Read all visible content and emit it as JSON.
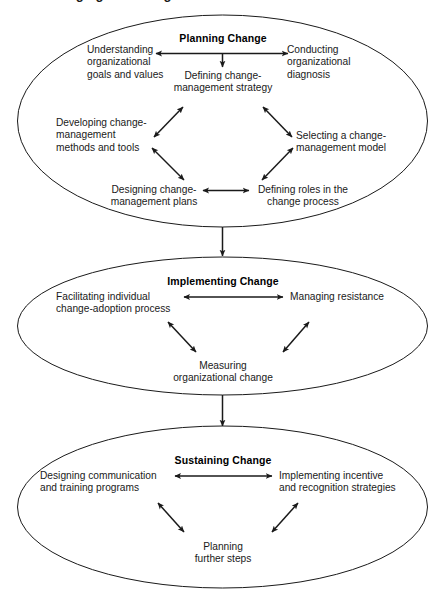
{
  "figure": {
    "title": "Managing the Change Process",
    "title_truncated": true,
    "background_color": "#ffffff",
    "line_color": "#1a1a1a",
    "text_color": "#1a1a1a"
  },
  "stages": [
    {
      "id": "planning",
      "title": "Planning Change",
      "nodes": [
        {
          "id": "understanding-goals",
          "text": "Understanding\norganizational\ngoals and values"
        },
        {
          "id": "conducting-diagnosis",
          "text": "Conducting\norganizational\ndiagnosis"
        },
        {
          "id": "defining-strategy",
          "text": "Defining change-\nmanagement strategy"
        },
        {
          "id": "developing-methods",
          "text": "Developing change-\nmanagement\nmethods and tools"
        },
        {
          "id": "selecting-model",
          "text": "Selecting a change-\nmanagement model"
        },
        {
          "id": "designing-plans",
          "text": "Designing change-\nmanagement plans"
        },
        {
          "id": "defining-roles",
          "text": "Defining roles in the\nchange process"
        }
      ]
    },
    {
      "id": "implementing",
      "title": "Implementing Change",
      "nodes": [
        {
          "id": "facilitating-adoption",
          "text": "Facilitating individual\nchange-adoption process"
        },
        {
          "id": "managing-resistance",
          "text": "Managing resistance"
        },
        {
          "id": "measuring-change",
          "text": "Measuring\norganizational change"
        }
      ]
    },
    {
      "id": "sustaining",
      "title": "Sustaining Change",
      "nodes": [
        {
          "id": "designing-communication",
          "text": "Designing communication\nand training programs"
        },
        {
          "id": "implementing-incentive",
          "text": "Implementing incentive\nand recognition strategies"
        },
        {
          "id": "planning-further",
          "text": "Planning\nfurther steps"
        }
      ]
    }
  ],
  "labels": {
    "planning_title": "Planning Change",
    "implementing_title": "Implementing Change",
    "sustaining_title": "Sustaining Change",
    "understanding_goals_l1": "Understanding",
    "understanding_goals_l2": "organizational",
    "understanding_goals_l3": "goals and values",
    "conducting_diagnosis_l1": "Conducting",
    "conducting_diagnosis_l2": "organizational",
    "conducting_diagnosis_l3": "diagnosis",
    "defining_strategy_l1": "Defining change-",
    "defining_strategy_l2": "management strategy",
    "developing_methods_l1": "Developing change-",
    "developing_methods_l2": "management",
    "developing_methods_l3": "methods and tools",
    "selecting_model_l1": "Selecting a change-",
    "selecting_model_l2": "management model",
    "designing_plans_l1": "Designing change-",
    "designing_plans_l2": "management plans",
    "defining_roles_l1": "Defining roles in the",
    "defining_roles_l2": "change process",
    "facilitating_adoption_l1": "Facilitating individual",
    "facilitating_adoption_l2": "change-adoption process",
    "managing_resistance_l1": "Managing resistance",
    "measuring_change_l1": "Measuring",
    "measuring_change_l2": "organizational change",
    "designing_communication_l1": "Designing communication",
    "designing_communication_l2": "and training programs",
    "implementing_incentive_l1": "Implementing incentive",
    "implementing_incentive_l2": "and recognition strategies",
    "planning_further_l1": "Planning",
    "planning_further_l2": "further steps",
    "figure_title": "Managing the Change Process"
  }
}
